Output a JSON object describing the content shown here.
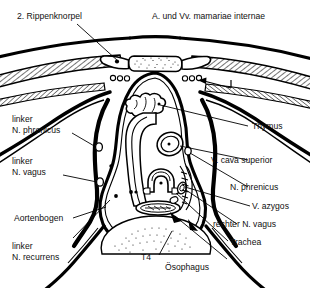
{
  "figure": {
    "vertebra_level": "T4",
    "line_color": "#000000",
    "background": "#ffffff",
    "hatch_fill": "#ffffff",
    "stipple_color": "#111111"
  },
  "labels": {
    "rippenknorpel": "2. Rippenknorpel",
    "mamariae": "A. und Vv. mamariae internae",
    "phrenicus_links_1": "linker",
    "phrenicus_links_2": "N. phrenicus",
    "vagus_links_1": "linker",
    "vagus_links_2": "N. vagus",
    "aortenbogen": "Aortenbogen",
    "recurrens_1": "linker",
    "recurrens_2": "N. recurrens",
    "t4": "T4",
    "thymus": "Thymus",
    "cava_superior": "V. cava superior",
    "phrenicus": "N. phrenicus",
    "azygos": "V. azygos",
    "vagus_rechts": "rechter N. vagus",
    "trachea": "Trachea",
    "oesophagus": "Ösophagus"
  },
  "structures": [
    {
      "name": "sternum",
      "label_ref": "none"
    },
    {
      "name": "rib-cartilage-left",
      "label_ref": "rippenknorpel"
    },
    {
      "name": "internal-mammary-vessels",
      "label_ref": "mamariae"
    },
    {
      "name": "thymus",
      "label_ref": "thymus"
    },
    {
      "name": "superior-vena-cava",
      "label_ref": "cava_superior"
    },
    {
      "name": "phrenic-nerve-right",
      "label_ref": "phrenicus"
    },
    {
      "name": "azygos-vein",
      "label_ref": "azygos"
    },
    {
      "name": "vagus-nerve-right",
      "label_ref": "vagus_rechts"
    },
    {
      "name": "trachea",
      "label_ref": "trachea"
    },
    {
      "name": "oesophagus",
      "label_ref": "oesophagus"
    },
    {
      "name": "aortic-arch",
      "label_ref": "aortenbogen"
    },
    {
      "name": "recurrent-laryngeal-nerve-left",
      "label_ref": "recurrens_2"
    },
    {
      "name": "phrenic-nerve-left",
      "label_ref": "phrenicus_links_2"
    },
    {
      "name": "vagus-nerve-left",
      "label_ref": "vagus_links_2"
    },
    {
      "name": "thoracic-vertebra-t4",
      "label_ref": "t4"
    }
  ]
}
